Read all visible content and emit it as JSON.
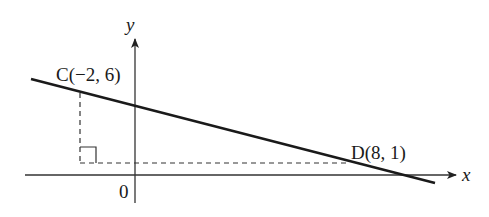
{
  "diagram": {
    "axes": {
      "x_label": "x",
      "y_label": "y",
      "origin_label": "0"
    },
    "points": [
      {
        "name": "C",
        "label": "C(−2, 6)",
        "x": -2,
        "y": 6
      },
      {
        "name": "D",
        "label": "D(8, 1)",
        "x": 8,
        "y": 1
      }
    ],
    "line": {
      "through": [
        "C",
        "D"
      ]
    },
    "construction": {
      "dashed_vertical_from": "C",
      "dashed_horizontal_to": "D",
      "right_angle_marker": true
    },
    "colors": {
      "line": "#1a1a1a",
      "axes": "#333333",
      "dashed": "#333333",
      "background": "#ffffff"
    }
  }
}
